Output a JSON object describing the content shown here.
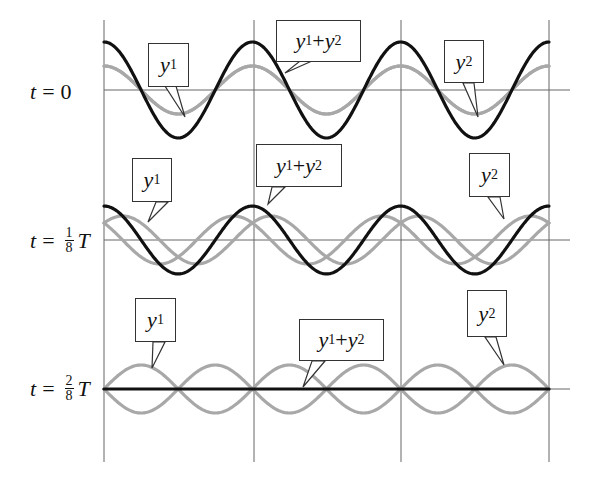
{
  "chart_data": {
    "type": "line",
    "title": "",
    "xlabel": "",
    "ylabel": "",
    "grid": {
      "vertical_lines": 4
    },
    "panels": [
      {
        "label": "t = 0",
        "time_fraction_T": 0,
        "series": [
          {
            "name": "y1",
            "color": "#a8a8a8",
            "amplitude": 1,
            "phase_shift_cycles": 0
          },
          {
            "name": "y2",
            "color": "#a8a8a8",
            "amplitude": 1,
            "phase_shift_cycles": 0
          },
          {
            "name": "y1 + y2",
            "color": "#111111",
            "amplitude": 2
          }
        ],
        "callouts": [
          "y1",
          "y1 + y2",
          "y2"
        ]
      },
      {
        "label": "t = 1/8 T",
        "time_fraction_T": 0.125,
        "series": [
          {
            "name": "y1",
            "color": "#a8a8a8",
            "amplitude": 1,
            "phase_shift_cycles": 0.125
          },
          {
            "name": "y2",
            "color": "#a8a8a8",
            "amplitude": 1,
            "phase_shift_cycles": -0.125
          },
          {
            "name": "y1 + y2",
            "color": "#111111",
            "amplitude": 1.414
          }
        ],
        "callouts": [
          "y1",
          "y1 + y2",
          "y2"
        ]
      },
      {
        "label": "t = 2/8 T",
        "time_fraction_T": 0.25,
        "series": [
          {
            "name": "y1",
            "color": "#a8a8a8",
            "amplitude": 1,
            "phase_shift_cycles": 0.25
          },
          {
            "name": "y2",
            "color": "#a8a8a8",
            "amplitude": 1,
            "phase_shift_cycles": -0.25
          },
          {
            "name": "y1 + y2",
            "color": "#111111",
            "amplitude": 0
          }
        ],
        "callouts": [
          "y1",
          "y1 + y2",
          "y2"
        ]
      }
    ],
    "cycles_shown": 3
  },
  "rows": [
    {
      "t": "t",
      "eq": "=",
      "value": "0",
      "frac": null,
      "unit": ""
    },
    {
      "t": "t",
      "eq": "=",
      "value": "",
      "frac": {
        "num": "1",
        "den": "8"
      },
      "unit": "T"
    },
    {
      "t": "t",
      "eq": "=",
      "value": "",
      "frac": {
        "num": "2",
        "den": "8"
      },
      "unit": "T"
    }
  ],
  "callouts": {
    "y": "y",
    "sub1": "1",
    "sub2": "2",
    "plus": " + "
  },
  "colors": {
    "sum": "#111111",
    "component": "#a8a8a8",
    "grid": "#666666"
  }
}
